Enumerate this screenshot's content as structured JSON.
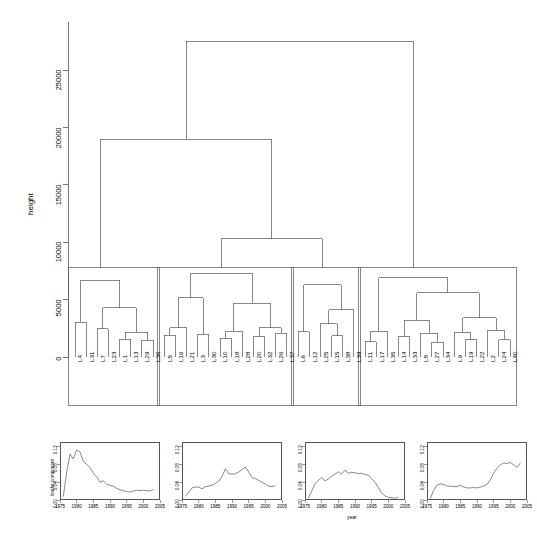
{
  "figure": {
    "type": "dendrogram-with-timeseries-panels",
    "background": "#ffffff",
    "line_color": "#555555"
  },
  "dendrogram": {
    "y_axis_title": "height",
    "y_ticks": [
      "0",
      "5000",
      "10000",
      "15000",
      "20000",
      "25000"
    ],
    "y_tick_values": [
      0,
      5000,
      10000,
      15000,
      20000,
      25000
    ],
    "y_range": [
      0,
      28500
    ],
    "n_clusters": 4,
    "n_leaves": 40,
    "leaf_labels": [
      "L4",
      "L31",
      "L7",
      "L23",
      "L1",
      "L13",
      "L29",
      "L36",
      "L5",
      "L16",
      "L21",
      "L3",
      "L30",
      "L10",
      "L18",
      "L28",
      "L20",
      "L32",
      "L26",
      "L37",
      "L6",
      "L12",
      "L25",
      "L15",
      "L38",
      "L39",
      "L11",
      "L17",
      "L35",
      "L14",
      "L33",
      "L8",
      "L27",
      "L34",
      "L9",
      "L19",
      "L22",
      "L2",
      "L24",
      "L40"
    ],
    "clusters": [
      {
        "id": 1,
        "box_height": 7800,
        "leaves": [
          "L4",
          "L31",
          "L7",
          "L23",
          "L1",
          "L13",
          "L29",
          "L36"
        ]
      },
      {
        "id": 2,
        "box_height": 7800,
        "leaves": [
          "L5",
          "L16",
          "L21",
          "L3",
          "L30",
          "L10",
          "L18",
          "L28",
          "L20",
          "L32",
          "L26",
          "L37"
        ]
      },
      {
        "id": 3,
        "box_height": 7800,
        "leaves": [
          "L6",
          "L12",
          "L25",
          "L15",
          "L38",
          "L39"
        ]
      },
      {
        "id": 4,
        "box_height": 7800,
        "leaves": [
          "L11",
          "L17",
          "L35",
          "L14",
          "L33",
          "L8",
          "L27",
          "L34",
          "L9",
          "L19",
          "L22",
          "L2",
          "L24",
          "L40"
        ]
      }
    ],
    "merge_heights": {
      "root": 27500,
      "c1_with_c2c3": 19000,
      "c2_with_c3": 10300
    }
  },
  "chart_data": [
    {
      "type": "line",
      "panel": 1,
      "title": "",
      "xlabel": "",
      "ylabel": "leader component",
      "xlim": [
        1975,
        2005
      ],
      "ylim": [
        0.0,
        0.13
      ],
      "x_ticks": [
        "1975",
        "1980",
        "1985",
        "1990",
        "1995",
        "2000",
        "2005"
      ],
      "y_ticks": [
        "0.00",
        "0.04",
        "0.08",
        "0.12"
      ],
      "grid": false,
      "x": [
        1976,
        1977,
        1978,
        1979,
        1980,
        1981,
        1982,
        1983,
        1984,
        1985,
        1986,
        1987,
        1988,
        1989,
        1990,
        1991,
        1992,
        1993,
        1994,
        1995,
        1996,
        1997,
        1998,
        1999,
        2000,
        2001,
        2002,
        2003
      ],
      "values": [
        0.008,
        0.062,
        0.103,
        0.092,
        0.112,
        0.108,
        0.086,
        0.08,
        0.073,
        0.06,
        0.052,
        0.04,
        0.043,
        0.035,
        0.033,
        0.031,
        0.026,
        0.023,
        0.021,
        0.019,
        0.018,
        0.02,
        0.022,
        0.021,
        0.022,
        0.021,
        0.02,
        0.024
      ]
    },
    {
      "type": "line",
      "panel": 2,
      "title": "",
      "xlabel": "",
      "ylabel": "",
      "xlim": [
        1975,
        2005
      ],
      "ylim": [
        0.0,
        0.13
      ],
      "x_ticks": [
        "1975",
        "1980",
        "1985",
        "1990",
        "1995",
        "2000",
        "2005"
      ],
      "y_ticks": [
        "0.00",
        "0.04",
        "0.08",
        "0.12"
      ],
      "grid": false,
      "x": [
        1976,
        1977,
        1978,
        1979,
        1980,
        1981,
        1982,
        1983,
        1984,
        1985,
        1986,
        1987,
        1988,
        1989,
        1990,
        1991,
        1992,
        1993,
        1994,
        1995,
        1996,
        1997,
        1998,
        1999,
        2000,
        2001,
        2002,
        2003
      ],
      "values": [
        0.008,
        0.018,
        0.027,
        0.029,
        0.029,
        0.025,
        0.03,
        0.031,
        0.033,
        0.037,
        0.042,
        0.052,
        0.07,
        0.059,
        0.058,
        0.059,
        0.063,
        0.068,
        0.074,
        0.063,
        0.05,
        0.048,
        0.044,
        0.04,
        0.036,
        0.031,
        0.03,
        0.032
      ]
    },
    {
      "type": "line",
      "panel": 3,
      "title": "",
      "xlabel": "year",
      "ylabel": "",
      "xlim": [
        1975,
        2005
      ],
      "ylim": [
        0.0,
        0.13
      ],
      "x_ticks": [
        "1975",
        "1980",
        "1985",
        "1990",
        "1995",
        "2000",
        "2005"
      ],
      "y_ticks": [
        "0.00",
        "0.04",
        "0.08",
        "0.12"
      ],
      "grid": false,
      "x": [
        1976,
        1977,
        1978,
        1979,
        1980,
        1981,
        1982,
        1983,
        1984,
        1985,
        1986,
        1987,
        1988,
        1989,
        1990,
        1991,
        1992,
        1993,
        1994,
        1995,
        1996,
        1997,
        1998,
        1999,
        2000,
        2001,
        2002,
        2003
      ],
      "values": [
        0.004,
        0.02,
        0.036,
        0.044,
        0.05,
        0.043,
        0.047,
        0.053,
        0.058,
        0.063,
        0.058,
        0.067,
        0.06,
        0.062,
        0.061,
        0.059,
        0.06,
        0.057,
        0.056,
        0.048,
        0.04,
        0.028,
        0.016,
        0.009,
        0.006,
        0.005,
        0.004,
        0.006
      ]
    },
    {
      "type": "line",
      "panel": 4,
      "title": "",
      "xlabel": "",
      "ylabel": "",
      "xlim": [
        1975,
        2005
      ],
      "ylim": [
        0.0,
        0.13
      ],
      "x_ticks": [
        "1975",
        "1980",
        "1985",
        "1990",
        "1995",
        "2000",
        "2005"
      ],
      "y_ticks": [
        "0.00",
        "0.04",
        "0.08",
        "0.12"
      ],
      "grid": false,
      "x": [
        1976,
        1977,
        1978,
        1979,
        1980,
        1981,
        1982,
        1983,
        1984,
        1985,
        1986,
        1987,
        1988,
        1989,
        1990,
        1991,
        1992,
        1993,
        1994,
        1995,
        1996,
        1997,
        1998,
        1999,
        2000,
        2001,
        2002,
        2003
      ],
      "values": [
        0.003,
        0.022,
        0.033,
        0.036,
        0.035,
        0.031,
        0.031,
        0.03,
        0.03,
        0.033,
        0.029,
        0.027,
        0.027,
        0.028,
        0.027,
        0.029,
        0.031,
        0.035,
        0.045,
        0.06,
        0.071,
        0.079,
        0.083,
        0.082,
        0.084,
        0.079,
        0.073,
        0.083
      ]
    }
  ]
}
